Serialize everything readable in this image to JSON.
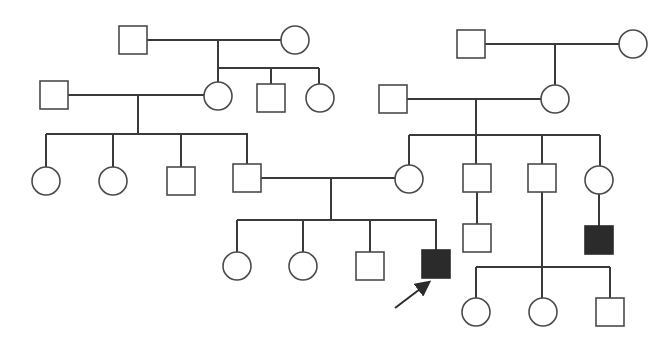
{
  "diagram": {
    "type": "pedigree-chart",
    "colors": {
      "line": "#3a3a3a",
      "unaffected_fill": "#ffffff",
      "affected_fill": "#2b2b2b",
      "background": "#ffffff"
    },
    "legend_note": "square = male, circle = female, filled = affected, arrow = proband",
    "individuals": [
      {
        "id": "I-1",
        "sex": "male",
        "affected": false,
        "cx": 133,
        "cy": 40
      },
      {
        "id": "I-2",
        "sex": "female",
        "affected": false,
        "cx": 295,
        "cy": 40
      },
      {
        "id": "I-3",
        "sex": "male",
        "affected": false,
        "cx": 471,
        "cy": 44
      },
      {
        "id": "I-4",
        "sex": "female",
        "affected": false,
        "cx": 633,
        "cy": 44
      },
      {
        "id": "II-1",
        "sex": "male",
        "affected": false,
        "cx": 54,
        "cy": 95
      },
      {
        "id": "II-2",
        "sex": "female",
        "affected": false,
        "cx": 218,
        "cy": 96
      },
      {
        "id": "II-3",
        "sex": "male",
        "affected": false,
        "cx": 271,
        "cy": 98
      },
      {
        "id": "II-4",
        "sex": "female",
        "affected": false,
        "cx": 320,
        "cy": 98
      },
      {
        "id": "II-5",
        "sex": "male",
        "affected": false,
        "cx": 393,
        "cy": 99
      },
      {
        "id": "II-6",
        "sex": "female",
        "affected": false,
        "cx": 555,
        "cy": 99
      },
      {
        "id": "III-1",
        "sex": "female",
        "affected": false,
        "cx": 46,
        "cy": 181
      },
      {
        "id": "III-2",
        "sex": "female",
        "affected": false,
        "cx": 113,
        "cy": 181
      },
      {
        "id": "III-3",
        "sex": "male",
        "affected": false,
        "cx": 181,
        "cy": 181
      },
      {
        "id": "III-4",
        "sex": "male",
        "affected": false,
        "cx": 247,
        "cy": 178
      },
      {
        "id": "III-5",
        "sex": "female",
        "affected": false,
        "cx": 409,
        "cy": 179
      },
      {
        "id": "III-6",
        "sex": "male",
        "affected": false,
        "cx": 477,
        "cy": 178
      },
      {
        "id": "III-7",
        "sex": "male",
        "affected": false,
        "cx": 542,
        "cy": 178
      },
      {
        "id": "III-8",
        "sex": "female",
        "affected": false,
        "cx": 599,
        "cy": 180
      },
      {
        "id": "IV-1",
        "sex": "female",
        "affected": false,
        "cx": 237,
        "cy": 266
      },
      {
        "id": "IV-2",
        "sex": "female",
        "affected": false,
        "cx": 303,
        "cy": 266
      },
      {
        "id": "IV-3",
        "sex": "male",
        "affected": false,
        "cx": 370,
        "cy": 266
      },
      {
        "id": "IV-4",
        "sex": "male",
        "affected": true,
        "proband": true,
        "cx": 436,
        "cy": 264
      },
      {
        "id": "IV-5",
        "sex": "male",
        "affected": false,
        "cx": 477,
        "cy": 238
      },
      {
        "id": "IV-6",
        "sex": "male",
        "affected": true,
        "cx": 599,
        "cy": 240
      },
      {
        "id": "IV-7",
        "sex": "female",
        "affected": false,
        "cx": 476,
        "cy": 312
      },
      {
        "id": "IV-8",
        "sex": "female",
        "affected": false,
        "cx": 543,
        "cy": 312
      },
      {
        "id": "IV-9",
        "sex": "male",
        "affected": false,
        "cx": 610,
        "cy": 312
      }
    ],
    "lines": [
      [
        147,
        40,
        281,
        40
      ],
      [
        218,
        40,
        218,
        68
      ],
      [
        218,
        68,
        319,
        68
      ],
      [
        218,
        68,
        218,
        82
      ],
      [
        271,
        68,
        271,
        84
      ],
      [
        319,
        68,
        319,
        84
      ],
      [
        68,
        95,
        204,
        95
      ],
      [
        138,
        95,
        138,
        134
      ],
      [
        46,
        134,
        248,
        134
      ],
      [
        46,
        134,
        46,
        167
      ],
      [
        113,
        134,
        113,
        167
      ],
      [
        181,
        134,
        181,
        167
      ],
      [
        247,
        134,
        247,
        164
      ],
      [
        485,
        44,
        619,
        44
      ],
      [
        555,
        44,
        555,
        85
      ],
      [
        407,
        99,
        541,
        99
      ],
      [
        476,
        99,
        476,
        135
      ],
      [
        409,
        135,
        600,
        135
      ],
      [
        409,
        135,
        409,
        165
      ],
      [
        476,
        135,
        476,
        164
      ],
      [
        542,
        135,
        542,
        164
      ],
      [
        600,
        135,
        600,
        166
      ],
      [
        261,
        178,
        395,
        178
      ],
      [
        331,
        178,
        331,
        220
      ],
      [
        237,
        220,
        437,
        220
      ],
      [
        237,
        220,
        237,
        252
      ],
      [
        303,
        220,
        303,
        252
      ],
      [
        370,
        220,
        370,
        252
      ],
      [
        436,
        220,
        436,
        250
      ],
      [
        477,
        192,
        477,
        224
      ],
      [
        599,
        194,
        599,
        226
      ],
      [
        542,
        192,
        542,
        298
      ],
      [
        476,
        267,
        610,
        267
      ],
      [
        476,
        267,
        476,
        298
      ],
      [
        610,
        267,
        610,
        298
      ]
    ],
    "proband_arrow": {
      "x1": 395,
      "y1": 308,
      "x2": 428,
      "y2": 283
    },
    "symbol_size": 28
  }
}
